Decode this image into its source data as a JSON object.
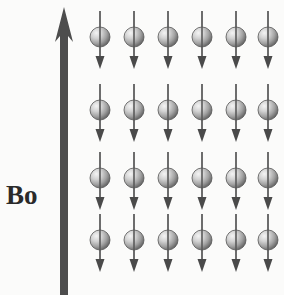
{
  "figure": {
    "type": "physics-diagram",
    "background_color": "#fbfbfa",
    "width": 284,
    "height": 295
  },
  "field_arrow": {
    "label": "Bo",
    "label_x": 6,
    "label_y": 182,
    "direction": "up",
    "color": "#4d4d4d",
    "shaft_x": 64,
    "shaft_width": 8,
    "shaft_top": 34,
    "shaft_bottom": 295,
    "head_apex_y": 7,
    "head_half_width": 9,
    "head_base_y": 42
  },
  "spin_grid": {
    "rows": 4,
    "columns": 6,
    "column_centers": [
      100,
      134,
      168,
      202,
      236,
      268
    ],
    "row_centers": [
      37,
      110,
      178,
      240
    ],
    "sphere_radius": 10,
    "sphere_light_color": "#f2f2f2",
    "sphere_mid_color": "#b6b6b6",
    "sphere_dark_color": "#6e6e6e",
    "sphere_edge_color": "#555555",
    "arrow_color": "#4a4a4a",
    "arrow_direction": "down",
    "arrow_shaft_width": 1.6,
    "arrow_shaft_above": 26,
    "arrow_shaft_below": 32,
    "arrow_head_width": 9,
    "arrow_head_length": 13
  },
  "spins": [
    {
      "row": 0,
      "col": 0,
      "cx": 100,
      "cy": 37,
      "orientation": "down"
    },
    {
      "row": 0,
      "col": 1,
      "cx": 134,
      "cy": 37,
      "orientation": "down"
    },
    {
      "row": 0,
      "col": 2,
      "cx": 168,
      "cy": 37,
      "orientation": "down"
    },
    {
      "row": 0,
      "col": 3,
      "cx": 202,
      "cy": 37,
      "orientation": "down"
    },
    {
      "row": 0,
      "col": 4,
      "cx": 236,
      "cy": 37,
      "orientation": "down"
    },
    {
      "row": 0,
      "col": 5,
      "cx": 268,
      "cy": 37,
      "orientation": "down"
    },
    {
      "row": 1,
      "col": 0,
      "cx": 100,
      "cy": 110,
      "orientation": "down"
    },
    {
      "row": 1,
      "col": 1,
      "cx": 134,
      "cy": 110,
      "orientation": "down"
    },
    {
      "row": 1,
      "col": 2,
      "cx": 168,
      "cy": 110,
      "orientation": "down"
    },
    {
      "row": 1,
      "col": 3,
      "cx": 202,
      "cy": 110,
      "orientation": "down"
    },
    {
      "row": 1,
      "col": 4,
      "cx": 236,
      "cy": 110,
      "orientation": "down"
    },
    {
      "row": 1,
      "col": 5,
      "cx": 268,
      "cy": 110,
      "orientation": "down"
    },
    {
      "row": 2,
      "col": 0,
      "cx": 100,
      "cy": 178,
      "orientation": "down"
    },
    {
      "row": 2,
      "col": 1,
      "cx": 134,
      "cy": 178,
      "orientation": "down"
    },
    {
      "row": 2,
      "col": 2,
      "cx": 168,
      "cy": 178,
      "orientation": "down"
    },
    {
      "row": 2,
      "col": 3,
      "cx": 202,
      "cy": 178,
      "orientation": "down"
    },
    {
      "row": 2,
      "col": 4,
      "cx": 236,
      "cy": 178,
      "orientation": "down"
    },
    {
      "row": 2,
      "col": 5,
      "cx": 268,
      "cy": 178,
      "orientation": "down"
    },
    {
      "row": 3,
      "col": 0,
      "cx": 100,
      "cy": 240,
      "orientation": "down"
    },
    {
      "row": 3,
      "col": 1,
      "cx": 134,
      "cy": 240,
      "orientation": "down"
    },
    {
      "row": 3,
      "col": 2,
      "cx": 168,
      "cy": 240,
      "orientation": "down"
    },
    {
      "row": 3,
      "col": 3,
      "cx": 202,
      "cy": 240,
      "orientation": "down"
    },
    {
      "row": 3,
      "col": 4,
      "cx": 236,
      "cy": 240,
      "orientation": "down"
    },
    {
      "row": 3,
      "col": 5,
      "cx": 268,
      "cy": 240,
      "orientation": "down"
    }
  ]
}
